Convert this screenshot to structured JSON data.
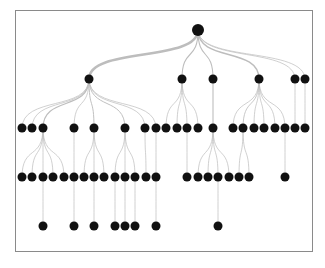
{
  "diagram": {
    "type": "tree",
    "orientation": "top-down",
    "colors": {
      "node": "#111111",
      "edge": "#bdbdbd",
      "frame": "#8a8a8a",
      "background": "#ffffff"
    },
    "root": {
      "id": "n0",
      "children": [
        {
          "id": "a",
          "children": [
            {
              "id": "a1"
            },
            {
              "id": "a2"
            },
            {
              "id": "a3",
              "children": [
                {
                  "id": "a3-1"
                },
                {
                  "id": "a3-2"
                },
                {
                  "id": "a3-3",
                  "children": [
                    {
                      "id": "a3-3-1"
                    }
                  ]
                },
                {
                  "id": "a3-4"
                },
                {
                  "id": "a3-5"
                }
              ]
            },
            {
              "id": "a4",
              "children": [
                {
                  "id": "a4-1",
                  "children": [
                    {
                      "id": "a4-1-1"
                    }
                  ]
                }
              ]
            },
            {
              "id": "a5",
              "children": [
                {
                  "id": "a5-1"
                },
                {
                  "id": "a5-2",
                  "children": [
                    {
                      "id": "a5-2-1"
                    }
                  ]
                },
                {
                  "id": "a5-3"
                }
              ]
            },
            {
              "id": "a6",
              "children": [
                {
                  "id": "a6-1",
                  "children": [
                    {
                      "id": "a6-1-1"
                    }
                  ]
                },
                {
                  "id": "a6-2",
                  "children": [
                    {
                      "id": "a6-2-1"
                    }
                  ]
                },
                {
                  "id": "a6-3",
                  "children": [
                    {
                      "id": "a6-3-1"
                    }
                  ]
                }
              ]
            },
            {
              "id": "a7",
              "children": [
                {
                  "id": "a7-1"
                }
              ]
            },
            {
              "id": "a8",
              "children": [
                {
                  "id": "a8-1",
                  "children": [
                    {
                      "id": "a8-1-1"
                    }
                  ]
                }
              ]
            }
          ]
        },
        {
          "id": "b",
          "children": [
            {
              "id": "b1"
            },
            {
              "id": "b2"
            },
            {
              "id": "b3",
              "children": [
                {
                  "id": "b3-1"
                }
              ]
            },
            {
              "id": "b4"
            }
          ]
        },
        {
          "id": "c",
          "children": [
            {
              "id": "c1",
              "children": [
                {
                  "id": "c1-1"
                },
                {
                  "id": "c1-2"
                },
                {
                  "id": "c1-3",
                  "children": [
                    {
                      "id": "c1-3-1"
                    }
                  ]
                },
                {
                  "id": "c1-4"
                }
              ]
            }
          ]
        },
        {
          "id": "d",
          "children": [
            {
              "id": "d1"
            },
            {
              "id": "d2",
              "children": [
                {
                  "id": "d2-1"
                },
                {
                  "id": "d2-2"
                }
              ]
            },
            {
              "id": "d3"
            },
            {
              "id": "d4"
            },
            {
              "id": "d5"
            },
            {
              "id": "d6",
              "children": [
                {
                  "id": "d6-1"
                }
              ]
            }
          ]
        },
        {
          "id": "e",
          "children": [
            {
              "id": "e1"
            }
          ]
        },
        {
          "id": "f",
          "children": [
            {
              "id": "f1"
            }
          ]
        }
      ]
    }
  }
}
